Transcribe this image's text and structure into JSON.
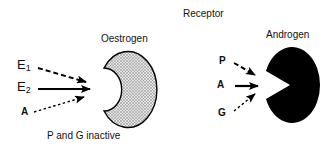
{
  "title": "Receptor",
  "receptors": [
    {
      "name": "Oestrogen",
      "shape": "crescent",
      "fill": "stippled-grey",
      "ligands": [
        {
          "label": "E",
          "sub": "1",
          "arrow": "dashed"
        },
        {
          "label": "E",
          "sub": "2",
          "arrow": "solid"
        },
        {
          "label": "A",
          "sub": "",
          "arrow": "dotted"
        }
      ],
      "note": "P and G inactive"
    },
    {
      "name": "Androgen",
      "shape": "pacman",
      "fill": "#000000",
      "ligands": [
        {
          "label": "P",
          "arrow": "dashed"
        },
        {
          "label": "A",
          "arrow": "solid"
        },
        {
          "label": "G",
          "arrow": "dotted"
        }
      ]
    }
  ],
  "colors": {
    "ink": "#000000",
    "stipple": "#9a9a9a",
    "background": "#ffffff"
  }
}
